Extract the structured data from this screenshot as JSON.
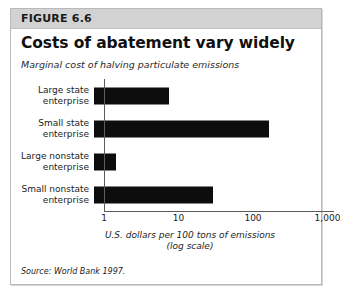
{
  "figure": {
    "number_label": "FIGURE 6.6",
    "source_note": "Source: World Bank 1997."
  },
  "chart_data": {
    "type": "bar",
    "orientation": "horizontal",
    "title": "Costs of abatement vary widely",
    "subtitle": "Marginal cost of halving particulate emissions",
    "xlabel_line1": "U.S. dollars per 100 tons of emissions",
    "xlabel_line2": "(log scale)",
    "ylabel": "",
    "scale": "log",
    "xlim": [
      1,
      1000
    ],
    "grid": false,
    "legend": "none",
    "tick_labels": [
      "1",
      "10",
      "100",
      "1,000"
    ],
    "tick_values": [
      1,
      10,
      100,
      1000
    ],
    "categories": [
      "Large state enterprise",
      "Small state enterprise",
      "Large nonstate enterprise",
      "Small nonstate enterprise"
    ],
    "category_lines": [
      [
        "Large state",
        "enterprise"
      ],
      [
        "Small state",
        "enterprise"
      ],
      [
        "Large nonstate",
        "enterprise"
      ],
      [
        "Small nonstate",
        "enterprise"
      ]
    ],
    "values": [
      10,
      220,
      2,
      40
    ],
    "bar_color": "#0d0d0d"
  }
}
